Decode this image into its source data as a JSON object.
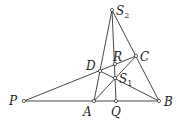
{
  "diagram": {
    "type": "geometry-figure",
    "points": [
      {
        "id": "S2",
        "name": "S",
        "sub": "2",
        "x": 112,
        "y": 10,
        "lx": 117,
        "ly": 15
      },
      {
        "id": "C",
        "name": "C",
        "sub": "",
        "x": 136,
        "y": 56,
        "lx": 140,
        "ly": 61
      },
      {
        "id": "R",
        "name": "R",
        "sub": "",
        "x": 115,
        "y": 64,
        "lx": 114,
        "ly": 61
      },
      {
        "id": "D",
        "name": "D",
        "sub": "",
        "x": 100,
        "y": 71,
        "lx": 86,
        "ly": 69
      },
      {
        "id": "S1",
        "name": "S",
        "sub": "1",
        "x": 115,
        "y": 78,
        "lx": 120,
        "ly": 84
      },
      {
        "id": "P",
        "name": "P",
        "sub": "",
        "x": 24,
        "y": 101,
        "lx": 10,
        "ly": 105
      },
      {
        "id": "A",
        "name": "A",
        "sub": "",
        "x": 94,
        "y": 101,
        "lx": 83,
        "ly": 115
      },
      {
        "id": "Q",
        "name": "Q",
        "sub": "",
        "x": 116,
        "y": 101,
        "lx": 111,
        "ly": 115
      },
      {
        "id": "B",
        "name": "B",
        "sub": "",
        "x": 159,
        "y": 101,
        "lx": 164,
        "ly": 106
      }
    ],
    "segments": [
      [
        "P",
        "B"
      ],
      [
        "P",
        "C"
      ],
      [
        "S2",
        "A"
      ],
      [
        "S2",
        "Q"
      ],
      [
        "S2",
        "B"
      ],
      [
        "A",
        "C"
      ],
      [
        "D",
        "B"
      ]
    ],
    "labels": {
      "S2": "S",
      "S2_sub": "2",
      "C": "C",
      "R": "R",
      "D": "D",
      "S1": "S",
      "S1_sub": "1",
      "P": "P",
      "A": "A",
      "Q": "Q",
      "B": "B"
    }
  }
}
